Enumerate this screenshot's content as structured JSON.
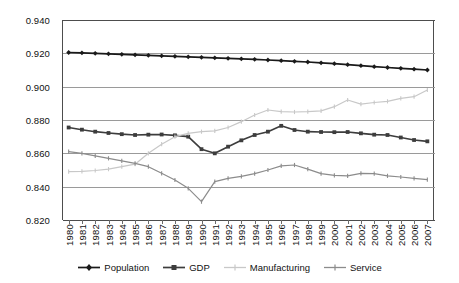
{
  "chart_data": {
    "type": "line",
    "title": "",
    "xlabel": "",
    "ylabel": "",
    "ylim": [
      0.82,
      0.94
    ],
    "ytick_step": 0.02,
    "ytick_labels": [
      "0.940",
      "0.920",
      "0.900",
      "0.880",
      "0.860",
      "0.840",
      "0.820"
    ],
    "ytick_values": [
      0.94,
      0.92,
      0.9,
      0.88,
      0.86,
      0.84,
      0.82
    ],
    "grid": true,
    "legend_position": "bottom",
    "categories": [
      "1980",
      "1981",
      "1982",
      "1983",
      "1984",
      "1985",
      "1986",
      "1987",
      "1988",
      "1989",
      "1990",
      "1991",
      "1992",
      "1993",
      "1994",
      "1995",
      "1996",
      "1997",
      "1998",
      "1999",
      "2000",
      "2001",
      "2002",
      "2003",
      "2004",
      "2005",
      "2006",
      "2007"
    ],
    "x": [
      1980,
      1981,
      1982,
      1983,
      1984,
      1985,
      1986,
      1987,
      1988,
      1989,
      1990,
      1991,
      1992,
      1993,
      1994,
      1995,
      1996,
      1997,
      1998,
      1999,
      2000,
      2001,
      2002,
      2003,
      2004,
      2005,
      2006,
      2007
    ],
    "series": [
      {
        "name": "Population",
        "color": "#1a1a1a",
        "marker": "diamond",
        "values": [
          0.9205,
          0.9203,
          0.92,
          0.9197,
          0.9194,
          0.9191,
          0.9188,
          0.9185,
          0.9182,
          0.9179,
          0.9176,
          0.9173,
          0.917,
          0.9167,
          0.9164,
          0.916,
          0.9156,
          0.9152,
          0.9148,
          0.9143,
          0.9138,
          0.9132,
          0.9126,
          0.912,
          0.9115,
          0.911,
          0.9105,
          0.91
        ]
      },
      {
        "name": "GDP",
        "color": "#3d3d3d",
        "marker": "square",
        "values": [
          0.8755,
          0.8742,
          0.873,
          0.8722,
          0.8715,
          0.871,
          0.8712,
          0.8713,
          0.8708,
          0.87,
          0.8625,
          0.86,
          0.864,
          0.8678,
          0.871,
          0.873,
          0.8765,
          0.874,
          0.873,
          0.8728,
          0.8727,
          0.8728,
          0.872,
          0.8712,
          0.871,
          0.8695,
          0.868,
          0.8672
        ]
      },
      {
        "name": "Manufacturing",
        "color": "#c8c8c8",
        "marker": "line",
        "values": [
          0.849,
          0.8492,
          0.8497,
          0.8505,
          0.852,
          0.8535,
          0.86,
          0.8655,
          0.87,
          0.872,
          0.873,
          0.8735,
          0.8755,
          0.879,
          0.883,
          0.886,
          0.885,
          0.8848,
          0.885,
          0.8855,
          0.888,
          0.892,
          0.8895,
          0.8905,
          0.8912,
          0.893,
          0.894,
          0.898
        ]
      },
      {
        "name": "Service",
        "color": "#8c8c8c",
        "marker": "line",
        "values": [
          0.861,
          0.86,
          0.8585,
          0.857,
          0.8555,
          0.854,
          0.852,
          0.848,
          0.844,
          0.839,
          0.831,
          0.843,
          0.845,
          0.8462,
          0.8478,
          0.85,
          0.8525,
          0.853,
          0.8505,
          0.8478,
          0.8468,
          0.8465,
          0.848,
          0.8478,
          0.8465,
          0.8458,
          0.845,
          0.8442
        ]
      }
    ]
  },
  "legend": {
    "items": [
      {
        "label": "Population"
      },
      {
        "label": "GDP"
      },
      {
        "label": "Manufacturing"
      },
      {
        "label": "Service"
      }
    ]
  }
}
